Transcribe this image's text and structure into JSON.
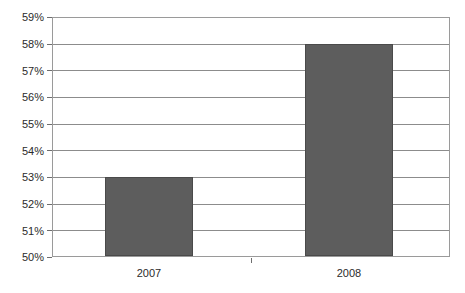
{
  "chart_data": {
    "type": "bar",
    "title": "",
    "subtitle": "",
    "xlabel": "",
    "ylabel": "",
    "categories": [
      "2007",
      "2008"
    ],
    "values": [
      53,
      58
    ],
    "value_suffix": "%",
    "ylim": [
      50,
      59
    ],
    "ytick_step": 1,
    "yticks": [
      "59%",
      "58%",
      "57%",
      "56%",
      "55%",
      "54%",
      "53%",
      "52%",
      "51%",
      "50%"
    ],
    "ytick_values": [
      59,
      58,
      57,
      56,
      55,
      54,
      53,
      52,
      51,
      50
    ],
    "grid": true,
    "legend": false,
    "legend_position": "none",
    "series": [
      {
        "name": "",
        "values": [
          53,
          58
        ]
      }
    ],
    "colors": {
      "bar_fill": "#5d5d5d",
      "bar_stroke": "#4a4a4a",
      "gridline": "#8c8c8c",
      "axis": "#9a9a9a",
      "tick": "#6e6e6e",
      "background": "#ffffff",
      "text": "#2b2b2b"
    }
  }
}
